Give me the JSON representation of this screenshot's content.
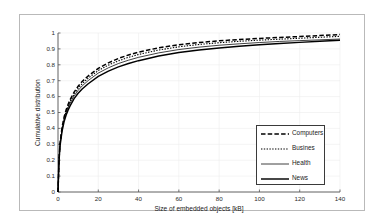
{
  "chart_data": {
    "type": "line",
    "title": "",
    "xlabel": "Size of embedded objects [kB]",
    "ylabel": "Cumulative distribution",
    "xlim": [
      0,
      140
    ],
    "ylim": [
      0,
      1
    ],
    "xticks": [
      "0",
      "20",
      "40",
      "60",
      "80",
      "100",
      "120",
      "140"
    ],
    "xtick_values": [
      0,
      20,
      40,
      60,
      80,
      100,
      120,
      140
    ],
    "yticks": [
      "0",
      "0.1",
      "0.2",
      "0.3",
      "0.4",
      "0.5",
      "0.6",
      "0.7",
      "0.8",
      "0.9",
      "1"
    ],
    "ytick_values": [
      0,
      0.1,
      0.2,
      0.3,
      0.4,
      0.5,
      0.6,
      0.7,
      0.8,
      0.9,
      1.0
    ],
    "grid": true,
    "legend_position": "lower right",
    "x": [
      0,
      0.5,
      1,
      2,
      3,
      4,
      5,
      6,
      8,
      10,
      12,
      15,
      20,
      25,
      30,
      35,
      40,
      50,
      60,
      70,
      80,
      90,
      100,
      110,
      120,
      130,
      140
    ],
    "series": [
      {
        "name": "Computers",
        "style": "dashed",
        "color": "#000000",
        "values": [
          0.0,
          0.205,
          0.305,
          0.405,
          0.47,
          0.515,
          0.55,
          0.58,
          0.628,
          0.665,
          0.695,
          0.73,
          0.778,
          0.812,
          0.84,
          0.862,
          0.88,
          0.907,
          0.926,
          0.94,
          0.951,
          0.959,
          0.966,
          0.972,
          0.978,
          0.984,
          0.99
        ]
      },
      {
        "name": "Busines",
        "style": "dotted",
        "color": "#000000",
        "values": [
          0.0,
          0.2,
          0.3,
          0.398,
          0.462,
          0.506,
          0.54,
          0.569,
          0.616,
          0.652,
          0.681,
          0.716,
          0.764,
          0.798,
          0.825,
          0.847,
          0.865,
          0.893,
          0.913,
          0.928,
          0.939,
          0.948,
          0.955,
          0.961,
          0.967,
          0.973,
          0.979
        ]
      },
      {
        "name": "Health",
        "style": "solid-thin",
        "color": "#000000",
        "values": [
          0.0,
          0.198,
          0.296,
          0.392,
          0.454,
          0.497,
          0.53,
          0.558,
          0.604,
          0.639,
          0.667,
          0.701,
          0.748,
          0.781,
          0.808,
          0.829,
          0.847,
          0.875,
          0.896,
          0.911,
          0.923,
          0.932,
          0.94,
          0.947,
          0.952,
          0.957,
          0.962
        ]
      },
      {
        "name": "News",
        "style": "solid-thick",
        "color": "#000000",
        "values": [
          0.0,
          0.193,
          0.288,
          0.381,
          0.441,
          0.483,
          0.515,
          0.542,
          0.587,
          0.621,
          0.648,
          0.681,
          0.727,
          0.76,
          0.787,
          0.808,
          0.826,
          0.855,
          0.877,
          0.893,
          0.906,
          0.917,
          0.926,
          0.934,
          0.941,
          0.948,
          0.955
        ]
      }
    ]
  },
  "legend": {
    "entries": [
      {
        "label": "Computers"
      },
      {
        "label": "Busines"
      },
      {
        "label": "Health"
      },
      {
        "label": "News"
      }
    ]
  }
}
